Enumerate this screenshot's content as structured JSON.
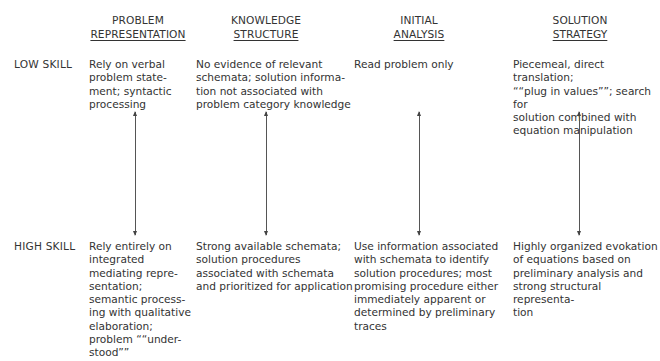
{
  "diagram": {
    "columns": [
      {
        "line1": "PROBLEM",
        "line2": "REPRESENTATION"
      },
      {
        "line1": "KNOWLEDGE",
        "line2": "STRUCTURE"
      },
      {
        "line1": "INITIAL",
        "line2": "ANALYSIS"
      },
      {
        "line1": "SOLUTION",
        "line2": "STRATEGY"
      }
    ],
    "rows": [
      {
        "label": "LOW SKILL",
        "cells": [
          "Rely on verbal\nproblem state-\nment; syntactic\nprocessing",
          "No evidence of relevant\nschemata; solution informa-\ntion not associated with\nproblem category knowledge",
          "Read problem only",
          "Piecemeal, direct translation;\n““plug in values””; search for\nsolution combined with\nequation manipulation"
        ]
      },
      {
        "label": "HIGH SKILL",
        "cells": [
          "Rely entirely on\nintegrated\nmediating repre-\nsentation;\nsemantic process-\ning with qualitative\nelaboration;\nproblem ““under-\nstood””",
          "Strong available schemata;\nsolution procedures\nassociated with schemata\nand prioritized for application",
          "Use information associated\nwith schemata to identify\nsolution procedures; most\npromising procedure either\nimmediately apparent or\ndetermined by preliminary\ntraces",
          "Highly organized evokation\nof equations based on\npreliminary analysis and\nstrong structural representa-\ntion"
        ]
      }
    ],
    "connector": "double-headed-arrow"
  }
}
